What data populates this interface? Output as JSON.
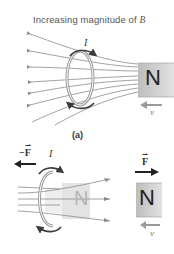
{
  "figure": {
    "title": "Increasing magnitude of B",
    "title_prefix": "Increasing magnitude of ",
    "title_var": "B",
    "panel_label": "(a)"
  },
  "top_panel": {
    "current_label": "I",
    "magnet_label": "N",
    "velocity_label": "v",
    "field_lines_count": 8
  },
  "bottom_panel": {
    "loop_force_label": "−F",
    "loop_force_minus": "−",
    "loop_force_var": "F",
    "current_label": "I",
    "ghost_magnet_label": "N",
    "magnet_force_label": "F",
    "magnet_label": "N",
    "velocity_label": "v"
  },
  "colors": {
    "field_line": "#8a8a8a",
    "loop_ring": "#9a9a9a",
    "current_arrow": "#3a3a3a",
    "magnet_fill": "#cfcfcf",
    "ghost_magnet_fill": "#e6e6e6",
    "velocity_arrow": "#9a9a9a",
    "force_arrow": "#222222",
    "text": "#555555"
  }
}
